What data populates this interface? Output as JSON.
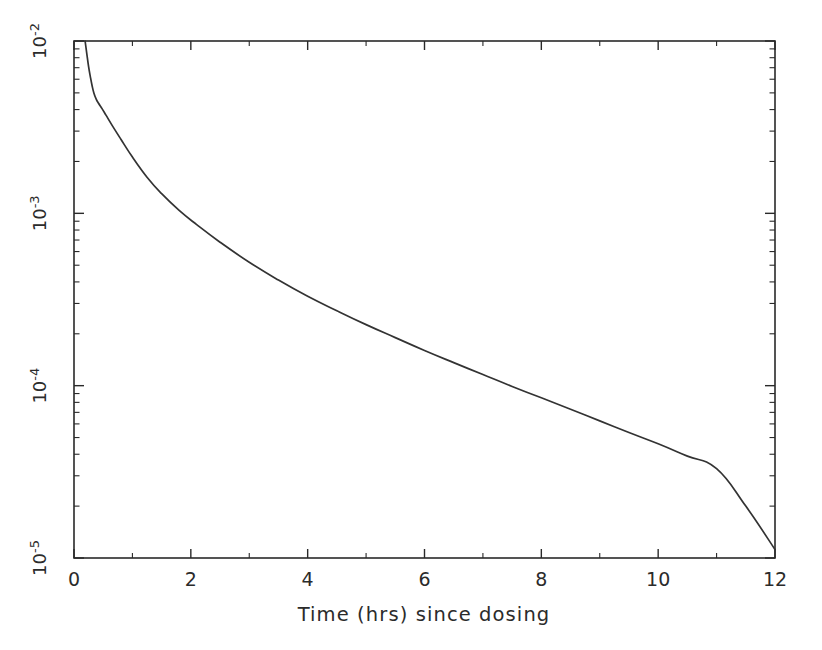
{
  "chart_data": {
    "type": "line",
    "title": "",
    "subtitle": "",
    "xlabel": "Time (hrs) since dosing",
    "ylabel": "",
    "xscale": "linear",
    "yscale": "log",
    "xlim": [
      0,
      12
    ],
    "ylim": [
      1e-05,
      0.01
    ],
    "grid": false,
    "legend": null,
    "legend_position": "none",
    "xticks": [
      0,
      2,
      4,
      6,
      8,
      10,
      12
    ],
    "xtick_labels": [
      "0",
      "2",
      "4",
      "6",
      "8",
      "10",
      "12"
    ],
    "xminor_ticks": [
      1,
      3,
      5,
      7,
      9,
      11
    ],
    "yticks": [
      0.01,
      0.001,
      0.0001,
      1e-05
    ],
    "ytick_labels": [
      "10-2",
      "10-3",
      "10-4",
      "10-5"
    ],
    "ytick_mantissa": [
      "10",
      "10",
      "10",
      "10"
    ],
    "ytick_exponent": [
      "-2",
      "-3",
      "-4",
      "-5"
    ],
    "ytick_label_rotation_deg": -90,
    "series": [
      {
        "name": "plasma concentration",
        "color": "#333333",
        "linewidth": 1.7,
        "x": [
          0.19,
          0.22,
          0.25,
          0.28,
          0.31,
          0.34,
          0.38,
          0.42,
          0.48,
          0.55,
          0.65,
          0.8,
          1.0,
          1.25,
          1.5,
          1.8,
          2.1,
          2.5,
          3.0,
          3.5,
          4.0,
          4.5,
          5.0,
          5.5,
          6.0,
          6.5,
          7.0,
          7.5,
          8.0,
          8.5,
          9.0,
          9.5,
          10.0,
          10.5,
          11.0,
          11.5,
          12.0
        ],
        "y": [
          0.01,
          0.0084,
          0.0071,
          0.0062,
          0.0055,
          0.005,
          0.0046,
          0.00435,
          0.00405,
          0.0037,
          0.00325,
          0.0027,
          0.00212,
          0.00162,
          0.0013,
          0.00104,
          0.00086,
          0.00068,
          0.00052,
          0.00041,
          0.00033,
          0.000272,
          0.000226,
          0.00019,
          0.00016,
          0.000136,
          0.000116,
          9.9e-05,
          8.5e-05,
          7.3e-05,
          6.25e-05,
          5.35e-05,
          4.6e-05,
          3.9e-05,
          3.3e-05,
          2e-05,
          1.12e-05
        ]
      }
    ],
    "annotations": []
  },
  "axes": {
    "x_title": "Time (hrs) since dosing",
    "x_labels": [
      "0",
      "2",
      "4",
      "6",
      "8",
      "10",
      "12"
    ],
    "y_labels": [
      {
        "base": "10",
        "exp": "-2"
      },
      {
        "base": "10",
        "exp": "-3"
      },
      {
        "base": "10",
        "exp": "-4"
      },
      {
        "base": "10",
        "exp": "-5"
      }
    ]
  },
  "style": {
    "background": "#ffffff",
    "axis_color": "#2a2a2a",
    "curve_color": "#333333",
    "text_color": "#2b2b2b"
  }
}
